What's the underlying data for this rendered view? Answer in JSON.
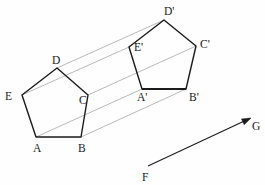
{
  "figure": {
    "background_color": "#fefefe",
    "stroke_color": "#1b1b1b",
    "guide_color": "#8c8c8c"
  },
  "chart_data": {
    "type": "diagram",
    "xlabel": "",
    "ylabel": "",
    "grid": false,
    "legend": "none",
    "shapes": [
      {
        "name": "pentagon-source",
        "labels": [
          "A",
          "B",
          "C",
          "D",
          "E"
        ],
        "points": [
          [
            36,
            137
          ],
          [
            81,
            137
          ],
          [
            88,
            95
          ],
          [
            57,
            68
          ],
          [
            22,
            95
          ]
        ]
      },
      {
        "name": "pentagon-image",
        "labels": [
          "A'",
          "B'",
          "C'",
          "D'",
          "E'"
        ],
        "points": [
          [
            142,
            89
          ],
          [
            186,
            89
          ],
          [
            196,
            46
          ],
          [
            164,
            20
          ],
          [
            129,
            47
          ]
        ]
      }
    ],
    "translation_vector": {
      "name": "vector-fg",
      "from_label": "F",
      "to_label": "G",
      "from": [
        148,
        166
      ],
      "to": [
        251,
        118
      ]
    },
    "correspondences": [
      {
        "from": "A",
        "to": "A'"
      },
      {
        "from": "B",
        "to": "B'"
      },
      {
        "from": "C",
        "to": "C'"
      },
      {
        "from": "D",
        "to": "D'"
      },
      {
        "from": "E",
        "to": "E'"
      }
    ]
  },
  "labels": {
    "A": {
      "text": "A",
      "x": 33,
      "y": 152
    },
    "B": {
      "text": "B",
      "x": 78,
      "y": 152
    },
    "C": {
      "text": "C",
      "x": 79,
      "y": 104
    },
    "D": {
      "text": "D",
      "x": 52,
      "y": 64
    },
    "E": {
      "text": "E",
      "x": 5,
      "y": 100
    },
    "Ap": {
      "text": "A'",
      "x": 137,
      "y": 101
    },
    "Bp": {
      "text": "B'",
      "x": 189,
      "y": 101
    },
    "Cp": {
      "text": "C'",
      "x": 200,
      "y": 48
    },
    "Dp": {
      "text": "D'",
      "x": 164,
      "y": 15
    },
    "Ep": {
      "text": "E'",
      "x": 134,
      "y": 51
    },
    "F": {
      "text": "F",
      "x": 142,
      "y": 181
    },
    "G": {
      "text": "G",
      "x": 252,
      "y": 130
    }
  }
}
